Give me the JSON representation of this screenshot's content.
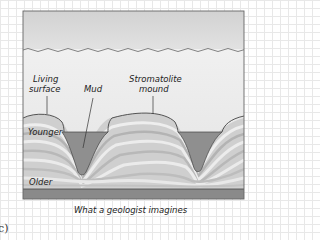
{
  "diagram": {
    "labels": {
      "living_surface_line1": "Living",
      "living_surface_line2": "surface",
      "mud": "Mud",
      "stromatolite_line1": "Stromatolite",
      "stromatolite_line2": "mound",
      "younger": "Younger",
      "older": "Older"
    },
    "caption": "What a geologist imagines",
    "panel_letter": "c)",
    "colors": {
      "sky": "#d9d9d9",
      "water": "#ececec",
      "mud": "#8f8f8f",
      "bedrock": "#8a8a8a",
      "layer_light": "#e6e6e6",
      "layer_dark": "#b5b5b5",
      "outline": "#444444"
    }
  }
}
